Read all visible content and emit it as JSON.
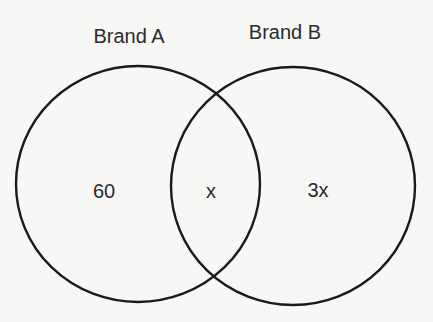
{
  "diagram": {
    "type": "venn",
    "sets": [
      {
        "id": "A",
        "label": "Brand A",
        "exclusive_value": "60",
        "cx": 138,
        "cy": 184,
        "rx": 122,
        "ry": 118
      },
      {
        "id": "B",
        "label": "Brand B",
        "exclusive_value": "3x",
        "cx": 293,
        "cy": 186,
        "rx": 122,
        "ry": 119
      }
    ],
    "intersection": {
      "sets": [
        "A",
        "B"
      ],
      "value": "x"
    },
    "stroke_color": "#1a1a1a",
    "background_color": "#f7f7f5"
  }
}
